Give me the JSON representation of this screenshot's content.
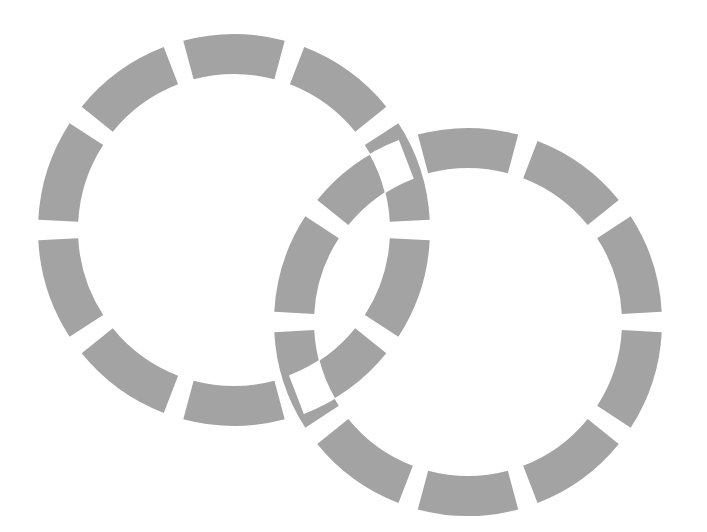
{
  "diagram": {
    "background": "#ffffff",
    "stroke_color": "#a3a3a3",
    "circles": [
      {
        "name": "circle-left",
        "cx": 234,
        "cy": 230,
        "r": 176,
        "stroke_width": 40,
        "dashes": 10,
        "dash_angle_deg": 30,
        "start_angle_deg": -90
      },
      {
        "name": "circle-right",
        "cx": 468,
        "cy": 322,
        "r": 174,
        "stroke_width": 40,
        "dashes": 10,
        "dash_angle_deg": 30,
        "start_angle_deg": -90
      }
    ],
    "overlap_mode": "xor"
  }
}
